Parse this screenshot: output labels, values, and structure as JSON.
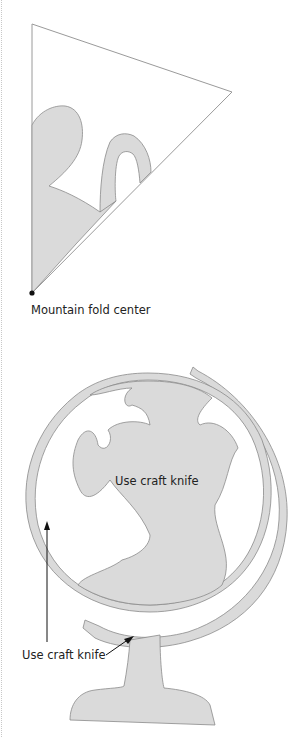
{
  "labels": {
    "fold": "Mountain fold center",
    "knife_inner": "Use craft knife",
    "knife_outer": "Use craft knife"
  },
  "colors": {
    "fill": "#dadada",
    "stroke": "#8a8a8a",
    "outline": "#9a9a9a",
    "text": "#222222"
  }
}
